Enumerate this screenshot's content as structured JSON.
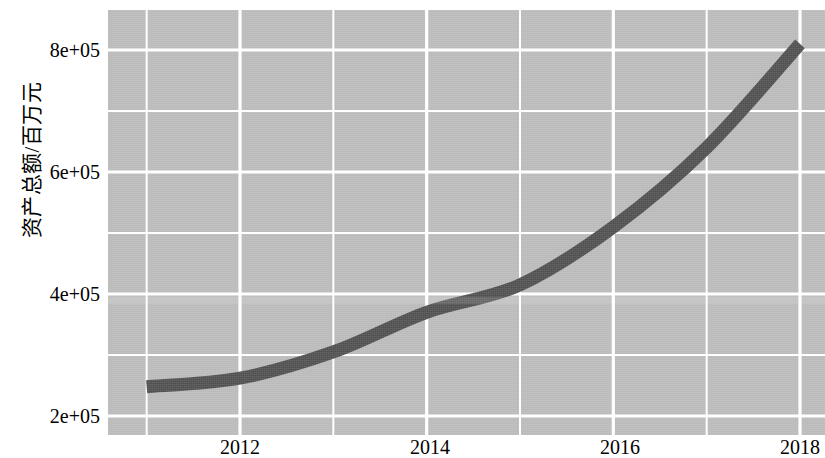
{
  "chart_data": {
    "type": "line",
    "title": "",
    "subtitle": "",
    "xlabel": "",
    "ylabel": "资产总额/百万元",
    "x": [
      2011,
      2012,
      2013,
      2014,
      2015,
      2016,
      2017,
      2018
    ],
    "series": [
      {
        "name": "资产总额",
        "values": [
          248000,
          262000,
          305000,
          370000,
          415000,
          510000,
          640000,
          810000
        ]
      }
    ],
    "xlim": [
      2010.6,
      2018.5
    ],
    "ylim": [
      185000,
      855000
    ],
    "xticks": [
      2012,
      2014,
      2016,
      2018
    ],
    "xticklabels": [
      "2012",
      "2014",
      "2016",
      "2018"
    ],
    "yticks": [
      200000,
      400000,
      600000,
      800000
    ],
    "yticklabels": [
      "2e+05",
      "4e+05",
      "6e+05",
      "8e+05"
    ],
    "grid": true,
    "grid_color": "#ffffff",
    "panel_color": "#b9b9b9",
    "line_color": "#4d4d4d",
    "line_width": 13,
    "legend": "none",
    "minor_gridlines_x": [
      2011,
      2013,
      2015,
      2017
    ],
    "minor_gridlines_y": [
      300000,
      500000,
      700000
    ]
  },
  "axis": {
    "y_title": "资产总额/百万元",
    "y_tick_labels": [
      "8e+05",
      "6e+05",
      "4e+05",
      "2e+05"
    ],
    "x_tick_labels": [
      "2012",
      "2014",
      "2016",
      "2018"
    ]
  }
}
